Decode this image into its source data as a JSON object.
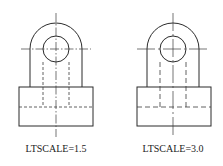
{
  "figures": [
    {
      "id": "left",
      "label": "LTSCALE=1.5",
      "ltscale": 1.5,
      "center": [
        56,
        49
      ],
      "outer_radius": 26,
      "inner_radius": 13,
      "base": {
        "x": 19,
        "y": 87,
        "width": 74,
        "height": 39
      },
      "hidden_section_y": 107,
      "centerline_dash": "9 2 1.5 2",
      "hidden_dash": "3 2"
    },
    {
      "id": "right",
      "label": "LTSCALE=3.0",
      "ltscale": 3.0,
      "center": [
        173,
        49
      ],
      "outer_radius": 26,
      "inner_radius": 13,
      "base": {
        "x": 137,
        "y": 87,
        "width": 74,
        "height": 39
      },
      "hidden_section_y": 107,
      "centerline_dash": "18 3 2 3",
      "hidden_dash": "5 3"
    }
  ],
  "colors": {
    "line": "#2b2b2b",
    "background": "#ffffff"
  }
}
